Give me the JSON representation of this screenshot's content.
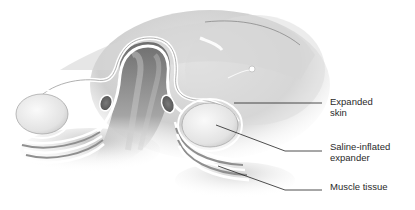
{
  "figure": {
    "type": "anatomical-illustration",
    "palette": {
      "background": "#ffffff",
      "skin": "#d9d9d9",
      "skin_dark": "#9a9a9a",
      "tissue_highlight": "#f4f4f4",
      "expander": "#ececec",
      "muscle": "#8a8a8a",
      "leader_line": "#222222",
      "label_text": "#2a2a2a"
    }
  },
  "labels": [
    {
      "id": "expanded-skin",
      "line1": "Expanded",
      "line2": "skin"
    },
    {
      "id": "saline-inflated-expander",
      "line1": "Saline-inflated",
      "line2": "expander"
    },
    {
      "id": "muscle-tissue",
      "line1": "Muscle tissue",
      "line2": ""
    }
  ]
}
